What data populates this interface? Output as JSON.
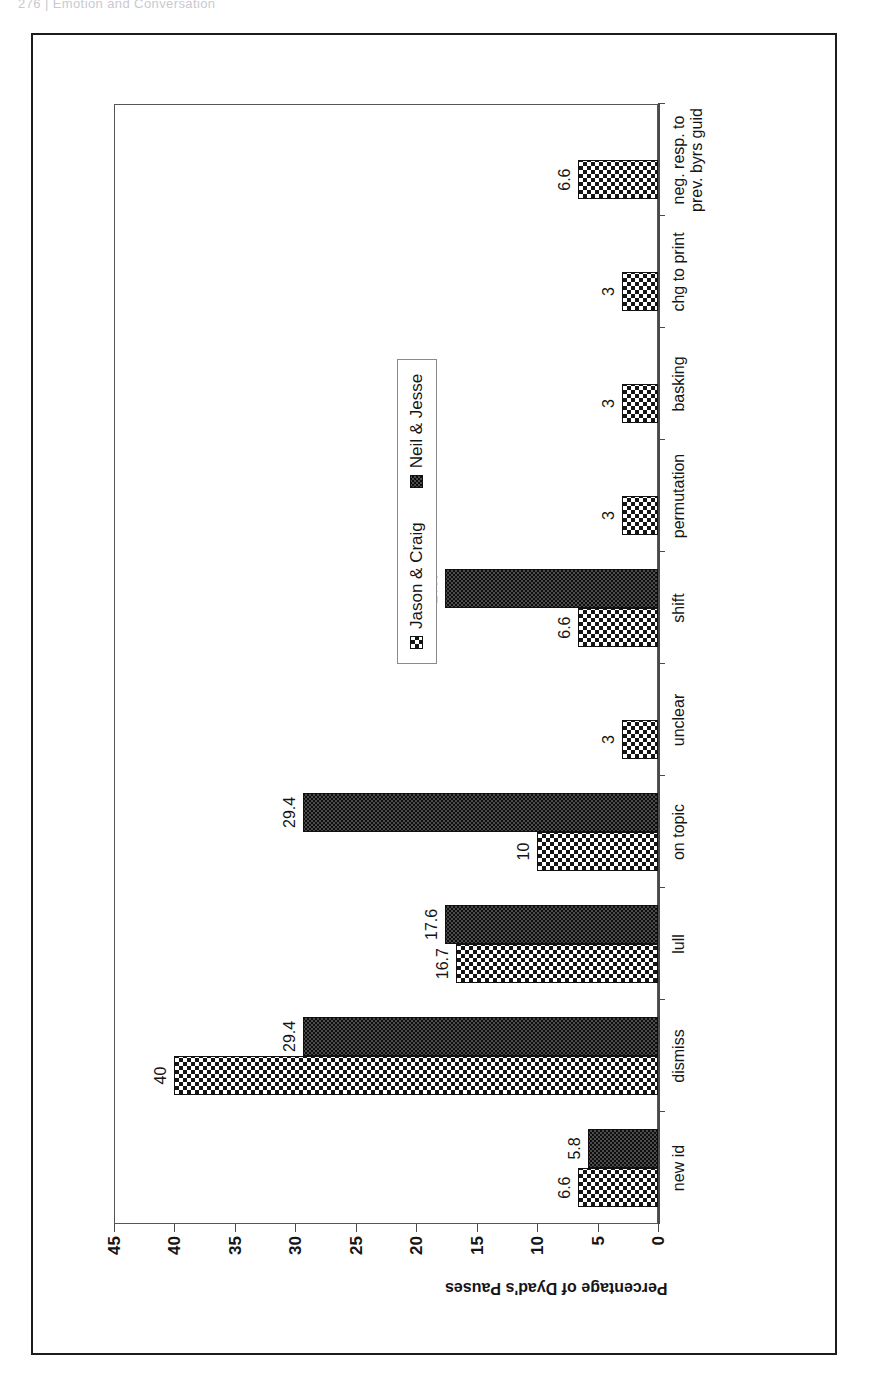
{
  "page": {
    "running_head": "276  |  Emotion and Conversation"
  },
  "chart_data": {
    "type": "bar",
    "orientation": "vertical-rotated-90",
    "title": "",
    "xlabel": "",
    "ylabel": "Percentage of Dyad's Pauses",
    "ylim": [
      0,
      45
    ],
    "ytick_labels": [
      "0",
      "5",
      "10",
      "15",
      "20",
      "25",
      "30",
      "35",
      "40",
      "45"
    ],
    "ytick_values": [
      0,
      5,
      10,
      15,
      20,
      25,
      30,
      35,
      40,
      45
    ],
    "grid": false,
    "legend_position": "center-right",
    "categories": [
      "new id",
      "dismiss",
      "lull",
      "on topic",
      "unclear",
      "shift",
      "permutation",
      "basking",
      "chg to print",
      "neg. resp. to prev. byrs guid"
    ],
    "series": [
      {
        "name": "Jason & Craig",
        "pattern": "checkerboard",
        "color": "#151515",
        "values": [
          6.6,
          40,
          16.7,
          10,
          3,
          6.6,
          3,
          3,
          3,
          6.6
        ],
        "labels": [
          "6.6",
          "40",
          "16.7",
          "10",
          "3",
          "6.6",
          "3",
          "3",
          "3",
          "6.6"
        ]
      },
      {
        "name": "Neil & Jesse",
        "pattern": "fine-dots",
        "color": "#4b4b4b",
        "values": [
          5.8,
          29.4,
          17.6,
          29.4,
          0,
          17.6,
          0,
          0,
          0,
          0
        ],
        "labels": [
          "5.8",
          "29.4",
          "17.6",
          "29.4",
          "",
          "17.6",
          "",
          "",
          "",
          ""
        ]
      }
    ]
  }
}
